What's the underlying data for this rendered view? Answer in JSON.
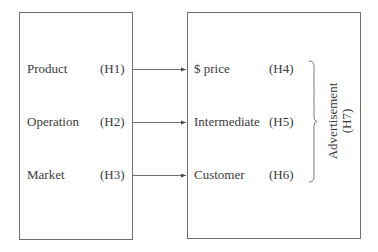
{
  "diagram": {
    "left_box": {
      "items": [
        {
          "label": "Product",
          "code": "(H1)"
        },
        {
          "label": "Operation",
          "code": "(H2)"
        },
        {
          "label": "Market",
          "code": "(H3)"
        }
      ]
    },
    "right_box": {
      "items": [
        {
          "label": "$ price",
          "code": "(H4)"
        },
        {
          "label": "Intermediate",
          "code": "(H5)"
        },
        {
          "label": "Customer",
          "code": "(H6)"
        }
      ],
      "group": {
        "label": "Advertisement",
        "code": "(H7)"
      }
    },
    "colors": {
      "line": "#6e6e6e",
      "text": "#3a3a3a"
    }
  }
}
